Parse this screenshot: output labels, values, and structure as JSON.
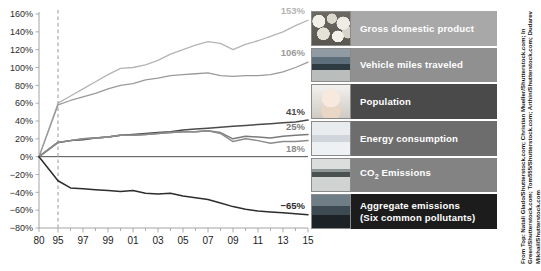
{
  "chart_data": {
    "type": "line",
    "title": "",
    "xlabel": "",
    "ylabel": "",
    "ylim": [
      -80,
      160
    ],
    "ytick_step": 20,
    "grid": false,
    "legend_position": "right",
    "yticks": [
      "160%",
      "140%",
      "120%",
      "100%",
      "80%",
      "60%",
      "40%",
      "20%",
      "0%",
      "−20%",
      "−40%",
      "−60%",
      "−80%"
    ],
    "xticks": [
      "80",
      "95",
      "97",
      "99",
      "01",
      "03",
      "05",
      "07",
      "09",
      "11",
      "13",
      "15"
    ],
    "x": [
      1980,
      1995,
      1996,
      1997,
      1998,
      1999,
      2000,
      2001,
      2002,
      2003,
      2004,
      2005,
      2006,
      2007,
      2008,
      2009,
      2010,
      2011,
      2012,
      2013,
      2014,
      2015
    ],
    "baseline_year": "1980",
    "marker_year": "95",
    "series": [
      {
        "name": "Gross domestic product",
        "end_label": "153%",
        "color": "#b4b4b4",
        "values": [
          0,
          60,
          68,
          76,
          84,
          92,
          99,
          100,
          103,
          108,
          115,
          120,
          125,
          129,
          127,
          120,
          126,
          130,
          135,
          140,
          147,
          153
        ]
      },
      {
        "name": "Vehicle miles traveled",
        "end_label": "106%",
        "color": "#9a9a9a",
        "values": [
          0,
          58,
          63,
          67,
          71,
          76,
          80,
          82,
          86,
          88,
          91,
          92,
          93,
          94,
          91,
          90,
          91,
          91,
          92,
          95,
          100,
          106
        ]
      },
      {
        "name": "Population",
        "end_label": "41%",
        "color": "#4a4a4a",
        "values": [
          0,
          16,
          18,
          19,
          21,
          22,
          24,
          25,
          26,
          27,
          28,
          30,
          31,
          32,
          33,
          34,
          35,
          36,
          37,
          38,
          39,
          41
        ]
      },
      {
        "name": "Energy consumption",
        "end_label": "25%",
        "color": "#7a7a7a",
        "values": [
          0,
          16,
          18,
          20,
          21,
          22,
          24,
          24,
          25,
          26,
          27,
          28,
          28,
          29,
          27,
          20,
          23,
          22,
          21,
          23,
          24,
          25
        ]
      },
      {
        "name": "CO₂ Emissions",
        "end_label": "18%",
        "color": "#8c8c8c",
        "values": [
          0,
          16,
          18,
          20,
          21,
          22,
          24,
          24,
          25,
          26,
          27,
          28,
          28,
          29,
          26,
          17,
          20,
          18,
          15,
          17,
          17,
          18
        ]
      },
      {
        "name": "Aggregate emissions (Six common pollutants)",
        "end_label": "−65%",
        "color": "#2d2d2d",
        "values": [
          0,
          -27,
          -35,
          -36,
          -37,
          -38,
          -39,
          -38,
          -41,
          -42,
          -41,
          -44,
          -46,
          -48,
          -52,
          -56,
          -59,
          -61,
          -62,
          -63,
          -64,
          -65
        ]
      }
    ]
  },
  "legend": {
    "items": [
      {
        "label": "Gross domestic product",
        "bar_color": "#a8a8a8",
        "thumb": "gdp-thumbnail"
      },
      {
        "label": "Vehicle miles traveled",
        "bar_color": "#909090",
        "thumb": "vehicle-thumbnail"
      },
      {
        "label": "Population",
        "bar_color": "#4a4a4a",
        "thumb": "baby-thumbnail"
      },
      {
        "label": "Energy consumption",
        "bar_color": "#6d6d6d",
        "thumb": "energy-thumbnail"
      },
      {
        "label": "CO2 Emissions",
        "label_main": "CO",
        "label_sub": "2",
        "label_rest": " Emissions",
        "bar_color": "#838383",
        "thumb": "co2-thumbnail"
      },
      {
        "label": "Aggregate emissions (Six common pollutants)",
        "line1": "Aggregate emissions",
        "line2": "(Six common pollutants)",
        "bar_color": "#1c1c1c",
        "thumb": "skyline-thumbnail"
      }
    ]
  },
  "credit": {
    "text": "From Top: Natali Glado/Shutterstock.com; Christian Mueller/Shutterstock.com; In Green/Shutterstock.com; Tom555/Shutterstock.com; Arthin/Shutterstock.com; Dudarev Mikhail/Shutterstock.com"
  }
}
